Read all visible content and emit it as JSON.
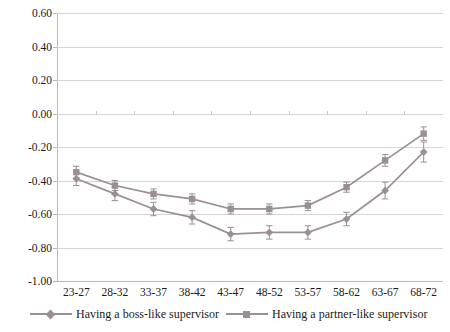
{
  "chart_data": {
    "type": "line",
    "title": "",
    "xlabel": "",
    "ylabel": "",
    "categories": [
      "23-27",
      "28-32",
      "33-37",
      "38-42",
      "43-47",
      "48-52",
      "53-57",
      "58-62",
      "63-67",
      "68-72"
    ],
    "ytick_labels": [
      "0.60",
      "0.40",
      "0.20",
      "0.00",
      "-0.20",
      "-0.40",
      "-0.60",
      "-0.80",
      "-1.00"
    ],
    "ytick_values": [
      0.6,
      0.4,
      0.2,
      0.0,
      -0.2,
      -0.4,
      -0.6,
      -0.8,
      -1.0
    ],
    "ylim": [
      -1.0,
      0.6
    ],
    "grid": true,
    "legend_position": "bottom",
    "series": [
      {
        "name": "Having a boss-like supervisor",
        "marker": "diamond",
        "color": "#9b8f96",
        "values": [
          -0.39,
          -0.48,
          -0.57,
          -0.62,
          -0.72,
          -0.71,
          -0.71,
          -0.63,
          -0.46,
          -0.23
        ],
        "errors": [
          0.04,
          0.04,
          0.04,
          0.04,
          0.04,
          0.04,
          0.04,
          0.04,
          0.05,
          0.06
        ]
      },
      {
        "name": "Having a partner-like supervisor",
        "marker": "square",
        "color": "#9b8f96",
        "values": [
          -0.35,
          -0.43,
          -0.48,
          -0.51,
          -0.57,
          -0.57,
          -0.55,
          -0.44,
          -0.28,
          -0.12
        ],
        "errors": [
          0.035,
          0.03,
          0.03,
          0.03,
          0.03,
          0.03,
          0.03,
          0.03,
          0.035,
          0.04
        ]
      }
    ]
  },
  "legend": {
    "items": [
      {
        "label": "Having a boss-like supervisor"
      },
      {
        "label": "Having a partner-like supervisor"
      }
    ]
  }
}
